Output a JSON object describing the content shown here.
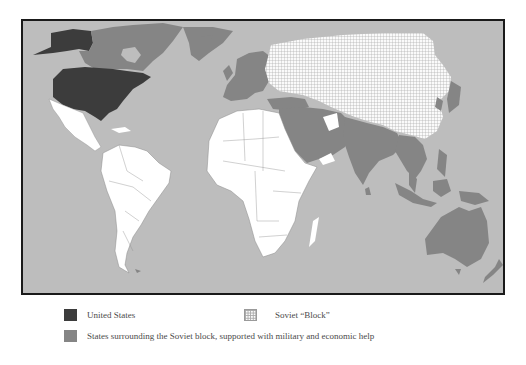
{
  "map": {
    "title": "",
    "colors": {
      "ocean": "#bdbdbd",
      "united_states": "#3c3c3c",
      "surrounding_states": "#858585",
      "soviet_block_fill": "#fafafa",
      "soviet_block_hatch": "#a8a8a8",
      "neutral_land": "#ffffff",
      "frame": "#1a1a1a"
    },
    "regions": [
      {
        "name": "United States",
        "category": "united_states"
      },
      {
        "name": "Canada",
        "category": "surrounding_states"
      },
      {
        "name": "Greenland",
        "category": "surrounding_states"
      },
      {
        "name": "Western Europe",
        "category": "surrounding_states"
      },
      {
        "name": "Turkey",
        "category": "surrounding_states"
      },
      {
        "name": "Middle East",
        "category": "surrounding_states"
      },
      {
        "name": "Pakistan / India",
        "category": "surrounding_states"
      },
      {
        "name": "Southeast Asia",
        "category": "surrounding_states"
      },
      {
        "name": "Japan / Korea / Taiwan",
        "category": "surrounding_states"
      },
      {
        "name": "Indonesia / Philippines",
        "category": "surrounding_states"
      },
      {
        "name": "Australia",
        "category": "surrounding_states"
      },
      {
        "name": "New Zealand",
        "category": "surrounding_states"
      },
      {
        "name": "Soviet Union / China / Eastern Europe",
        "category": "soviet_block"
      },
      {
        "name": "Latin America",
        "category": "neutral"
      },
      {
        "name": "Africa",
        "category": "neutral"
      }
    ]
  },
  "legend": {
    "items": [
      {
        "key": "united_states",
        "label": "United States"
      },
      {
        "key": "soviet_block",
        "label": "Soviet “Block”"
      },
      {
        "key": "surrounding_states",
        "label": "States surrounding the Soviet block, supported with military and economic help"
      }
    ]
  }
}
